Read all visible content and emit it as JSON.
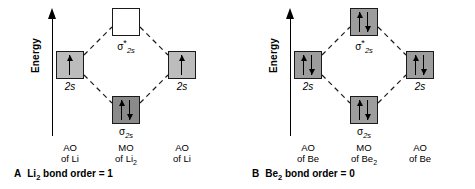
{
  "figure": {
    "panels": [
      {
        "id": "A",
        "caption_letter": "A",
        "caption_text_pre": "Li",
        "caption_text_sub": "2",
        "caption_text_post": " bond order = 1",
        "caption_full": "A Li2 bond order = 1",
        "axis": {
          "label": "Energy",
          "arrow": "up"
        },
        "orbitals": {
          "ao_left": {
            "label": "2s",
            "electrons": [
              "up"
            ],
            "fill": "fill-light"
          },
          "ao_right": {
            "label": "2s",
            "electrons": [
              "up"
            ],
            "fill": "fill-light"
          },
          "mo_anti": {
            "sigma": "σ",
            "star": "*",
            "sub": "2s",
            "electrons": [],
            "fill": "fill-none"
          },
          "mo_bond": {
            "sigma": "σ",
            "star": "",
            "sub": "2s",
            "electrons": [
              "up",
              "down"
            ],
            "fill": "fill-dark"
          }
        },
        "footers": {
          "left": {
            "line1": "AO",
            "line2_pre": "of ",
            "line2_atom": "Li",
            "line2_sub": ""
          },
          "middle": {
            "line1": "MO",
            "line2_pre": "of ",
            "line2_atom": "Li",
            "line2_sub": "2"
          },
          "right": {
            "line1": "AO",
            "line2_pre": "of ",
            "line2_atom": "Li",
            "line2_sub": ""
          }
        }
      },
      {
        "id": "B",
        "caption_letter": "B",
        "caption_text_pre": "Be",
        "caption_text_sub": "2",
        "caption_text_post": " bond order = 0",
        "caption_full": "B Be2 bond order = 0",
        "axis": {
          "label": "Energy",
          "arrow": "up"
        },
        "orbitals": {
          "ao_left": {
            "label": "2s",
            "electrons": [
              "up",
              "down"
            ],
            "fill": "fill-mid"
          },
          "ao_right": {
            "label": "2s",
            "electrons": [
              "up",
              "down"
            ],
            "fill": "fill-mid"
          },
          "mo_anti": {
            "sigma": "σ",
            "star": "*",
            "sub": "2s",
            "electrons": [
              "up",
              "down"
            ],
            "fill": "fill-mid"
          },
          "mo_bond": {
            "sigma": "σ",
            "star": "",
            "sub": "2s",
            "electrons": [
              "up",
              "down"
            ],
            "fill": "fill-mid"
          }
        },
        "footers": {
          "left": {
            "line1": "AO",
            "line2_pre": "of ",
            "line2_atom": "Be",
            "line2_sub": ""
          },
          "middle": {
            "line1": "MO",
            "line2_pre": "of ",
            "line2_atom": "Be",
            "line2_sub": "2"
          },
          "right": {
            "line1": "AO",
            "line2_pre": "of ",
            "line2_atom": "Be",
            "line2_sub": ""
          }
        }
      }
    ],
    "colors": {
      "line": "#1a1a1a",
      "box_light": "#bcbcbc",
      "box_mid": "#9d9d9d",
      "box_dark": "#8a8a8a",
      "box_empty": "#ffffff",
      "background": "#ffffff"
    }
  }
}
